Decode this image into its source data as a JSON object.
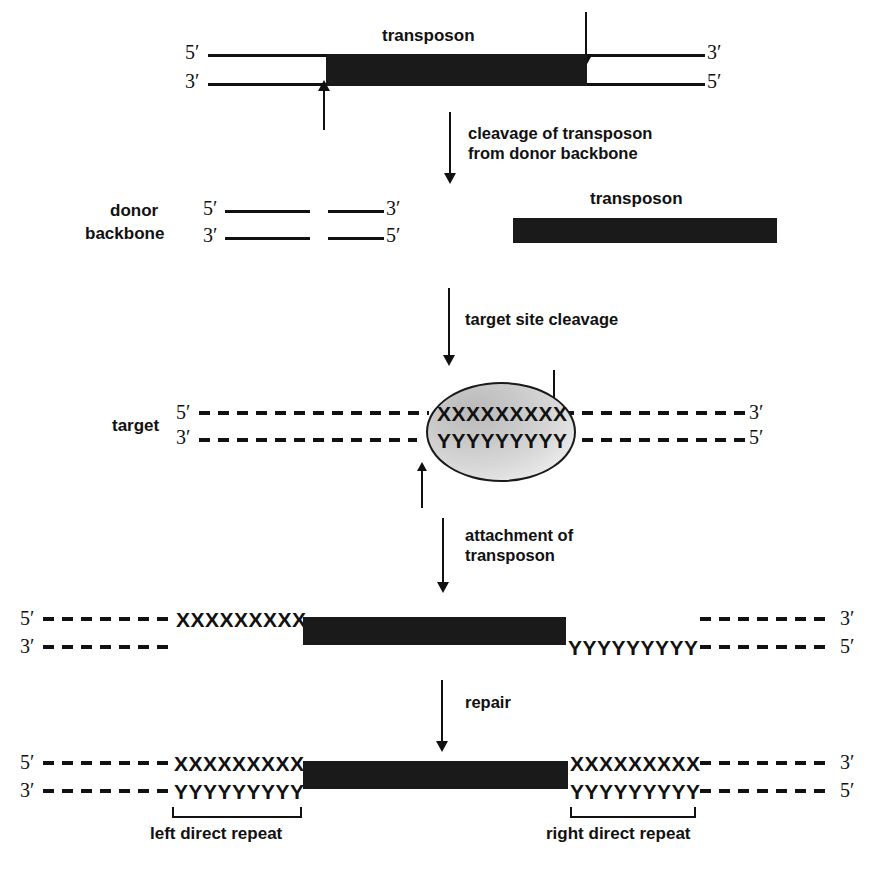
{
  "panels": {
    "donor": {
      "transposon_label": "transposon",
      "left_five_prime": "5′",
      "left_three_prime": "3′",
      "right_three_prime": "3′",
      "right_five_prime": "5′"
    },
    "cleaved": {
      "donor_label_line1": "donor",
      "donor_label_line2": "backbone",
      "left_five_prime": "5′",
      "left_three_prime": "3′",
      "right_three_prime": "3′",
      "right_five_prime": "5′",
      "transposon_label": "transposon"
    },
    "target": {
      "target_label": "target",
      "left_five_prime": "5′",
      "left_three_prime": "3′",
      "right_three_prime": "3′",
      "right_five_prime": "5′",
      "top_sequence": "XXXXXXXXX",
      "bottom_sequence": "YYYYYYYYY"
    },
    "attached": {
      "left_five_prime": "5′",
      "left_three_prime": "3′",
      "right_three_prime": "3′",
      "right_five_prime": "5′",
      "left_top_sequence": "XXXXXXXXX",
      "right_bottom_sequence": "YYYYYYYYY"
    },
    "repaired": {
      "left_five_prime": "5′",
      "left_three_prime": "3′",
      "right_three_prime": "3′",
      "right_five_prime": "5′",
      "left_top_sequence": "XXXXXXXXX",
      "left_bottom_sequence": "YYYYYYYYY",
      "right_top_sequence": "XXXXXXXXX",
      "right_bottom_sequence": "YYYYYYYYY",
      "left_repeat_label": "left direct repeat",
      "right_repeat_label": "right direct repeat"
    }
  },
  "steps": [
    {
      "line1": "cleavage of transposon",
      "line2": "from donor backbone"
    },
    {
      "line1": "target site cleavage",
      "line2": ""
    },
    {
      "line1": "attachment of",
      "line2": "transposon"
    },
    {
      "line1": "repair",
      "line2": ""
    }
  ],
  "colors": {
    "ink": "#111111",
    "transposon_fill": "#1a1a1a",
    "target_complex_fill": "#d0d0d0",
    "background": "#ffffff"
  }
}
